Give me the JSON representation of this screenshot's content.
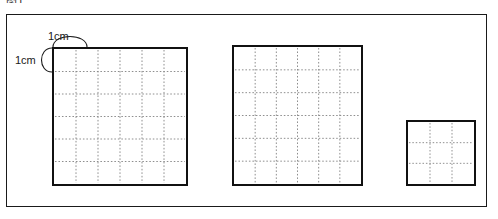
{
  "figure": {
    "caption_fragment": "图1",
    "background_color": "#ffffff",
    "frame": {
      "name": "outer-frame",
      "x": 6,
      "y": 14,
      "width": 481,
      "height": 193,
      "stroke_color": "#1a1a1a",
      "stroke_width": 1
    },
    "unit_labels": [
      {
        "id": "top",
        "text": "1cm",
        "x": 48,
        "y": 30,
        "arc": "horizontal"
      },
      {
        "id": "left",
        "text": "1cm",
        "x": 15,
        "y": 54,
        "arc": "vertical"
      }
    ],
    "squares": [
      {
        "id": "square-large-left",
        "label": "large square left",
        "x": 52,
        "y": 47,
        "width": 136,
        "height": 139,
        "columns": 6,
        "rows": 6,
        "cell_size_cm": 1,
        "side_length_cm": 6,
        "area_cm2": 36,
        "stroke_color": "#111111",
        "stroke_width": 2,
        "grid_color": "#8a8a8a",
        "grid_style": "dotted"
      },
      {
        "id": "square-large-middle",
        "label": "large square middle",
        "x": 232,
        "y": 45,
        "width": 131,
        "height": 141,
        "columns": 6,
        "rows": 6,
        "cell_size_cm": 1,
        "side_length_cm": 6,
        "area_cm2": 36,
        "stroke_color": "#111111",
        "stroke_width": 2,
        "grid_color": "#8a8a8a",
        "grid_style": "dotted"
      },
      {
        "id": "square-small-right",
        "label": "small square right",
        "x": 406,
        "y": 120,
        "width": 70,
        "height": 66,
        "columns": 3,
        "rows": 3,
        "cell_size_cm": 1,
        "side_length_cm": 3,
        "area_cm2": 9,
        "stroke_color": "#111111",
        "stroke_width": 2,
        "grid_color": "#8a8a8a",
        "grid_style": "dotted"
      }
    ]
  },
  "chart_data": {
    "type": "diagram",
    "title": "",
    "unit": "cm",
    "categories": [
      "large square left",
      "large square middle",
      "small square right"
    ],
    "values": [
      36,
      9,
      9
    ],
    "series": [
      {
        "name": "side length (cm)",
        "values": [
          6,
          6,
          3
        ]
      },
      {
        "name": "grid cells",
        "values": [
          36,
          36,
          9
        ]
      }
    ],
    "xlabel": "",
    "ylabel": ""
  }
}
